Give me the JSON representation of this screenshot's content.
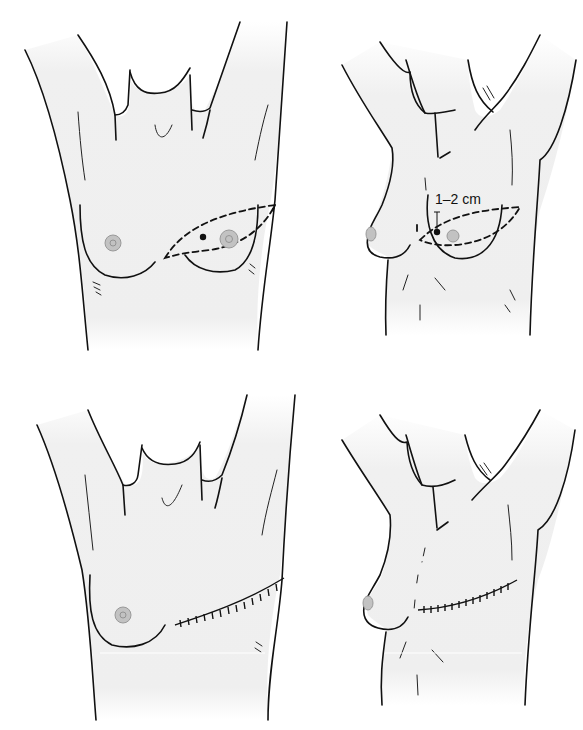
{
  "figure": {
    "layout": "2x2 grid",
    "background": "#ffffff",
    "skin_shade": "#f0f0f0",
    "line_color": "#111111",
    "nipple_color": "#bdbdbd"
  },
  "panels": [
    {
      "id": "top-left",
      "view": "frontal",
      "stage": "preoperative",
      "markings": [
        "elliptical excision outline (dashed)",
        "lesion dot",
        "nipple-areola within ellipse"
      ]
    },
    {
      "id": "top-right",
      "view": "oblique",
      "stage": "preoperative",
      "markings": [
        "elliptical excision outline (dashed)",
        "lesion dot",
        "margin indicator"
      ],
      "annotation": "1–2 cm"
    },
    {
      "id": "bottom-left",
      "view": "frontal",
      "stage": "postoperative",
      "markings": [
        "sutured transverse incision"
      ]
    },
    {
      "id": "bottom-right",
      "view": "oblique",
      "stage": "postoperative",
      "markings": [
        "sutured transverse incision"
      ]
    }
  ]
}
